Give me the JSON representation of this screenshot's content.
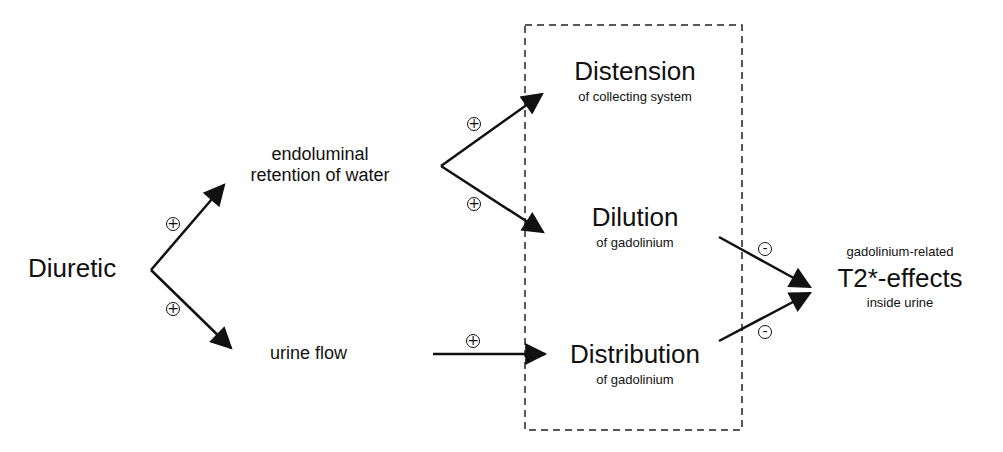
{
  "diagram": {
    "source": {
      "label": "Diuretic"
    },
    "intermediates": [
      {
        "id": "retention",
        "label": "endoluminal\nretention of water",
        "line1": "endoluminal",
        "line2": "retention of water"
      },
      {
        "id": "urine_flow",
        "label": "urine flow"
      }
    ],
    "box": {
      "style": "dashed",
      "items": [
        {
          "id": "distension",
          "title": "Distension",
          "subtitle": "of collecting system"
        },
        {
          "id": "dilution",
          "title": "Dilution",
          "subtitle": "of gadolinium"
        },
        {
          "id": "distribution",
          "title": "Distribution",
          "subtitle": "of gadolinium"
        }
      ]
    },
    "outcome": {
      "prefix": "gadolinium-related",
      "title": "T2*-effects",
      "suffix": "inside urine"
    },
    "edges": [
      {
        "from": "Diuretic",
        "to": "endoluminal retention of water",
        "sign": "+"
      },
      {
        "from": "Diuretic",
        "to": "urine flow",
        "sign": "+"
      },
      {
        "from": "endoluminal retention of water",
        "to": "Distension",
        "sign": "+"
      },
      {
        "from": "endoluminal retention of water",
        "to": "Dilution",
        "sign": "+"
      },
      {
        "from": "urine flow",
        "to": "Distribution",
        "sign": "+"
      },
      {
        "from": "Dilution",
        "to": "T2*-effects",
        "sign": "-"
      },
      {
        "from": "Distribution",
        "to": "T2*-effects",
        "sign": "-"
      }
    ],
    "signs": {
      "plus": "+",
      "minus": "-"
    }
  }
}
